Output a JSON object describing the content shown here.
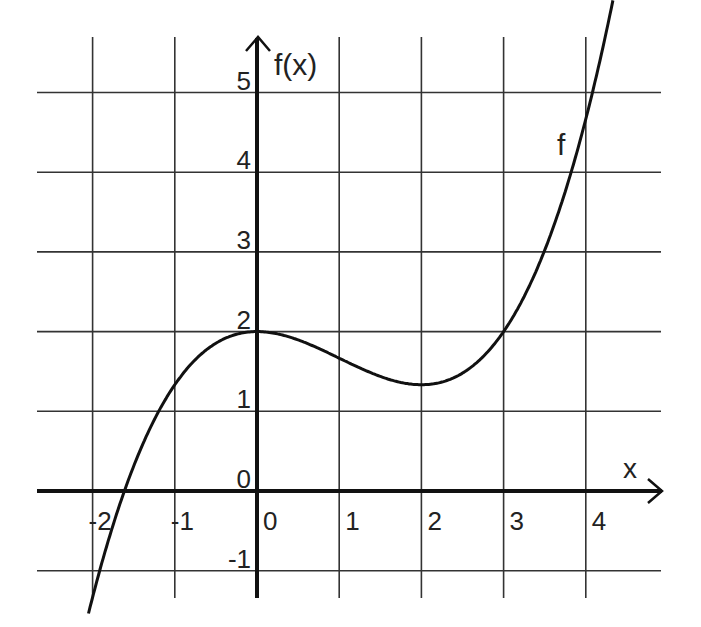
{
  "chart_data": {
    "type": "line",
    "title": "",
    "xlabel": "x",
    "ylabel": "f(x)",
    "function_label": "f",
    "xlim": [
      -2.0,
      4.4
    ],
    "ylim": [
      -1.0,
      5.0
    ],
    "grid": true,
    "legend": "none",
    "x_ticks": [
      -2,
      -1,
      0,
      1,
      2,
      3,
      4
    ],
    "x_tick_labels": [
      "-2",
      "-1",
      "0",
      "1",
      "2",
      "3",
      "4"
    ],
    "y_ticks": [
      -1,
      0,
      1,
      2,
      3,
      4,
      5
    ],
    "y_tick_labels": [
      "-1",
      "0",
      "1",
      "2",
      "3",
      "4",
      "5"
    ],
    "series": [
      {
        "name": "f",
        "x": [
          -2.1,
          -2.0,
          -1.7,
          -1.5,
          -1.0,
          -0.5,
          0.0,
          0.5,
          1.0,
          1.5,
          2.0,
          2.5,
          3.0,
          3.5,
          4.0,
          4.3
        ],
        "y": [
          -1.6,
          -1.2,
          0.0,
          0.4,
          1.33,
          1.85,
          2.0,
          1.9,
          1.7,
          1.5,
          1.38,
          1.5,
          2.0,
          2.9,
          4.45,
          5.7
        ]
      }
    ],
    "key_points": [
      {
        "x": 0,
        "y": 2,
        "note": "local maximum"
      },
      {
        "x": 2,
        "y": 1.33,
        "note": "local minimum"
      },
      {
        "x": 3,
        "y": 2
      },
      {
        "x": -1,
        "y": 1.33
      },
      {
        "x": -1.7,
        "y": 0,
        "note": "root"
      }
    ]
  },
  "colors": {
    "grid": "#333333",
    "axis": "#111111",
    "curve": "#111111",
    "background": "#ffffff"
  }
}
